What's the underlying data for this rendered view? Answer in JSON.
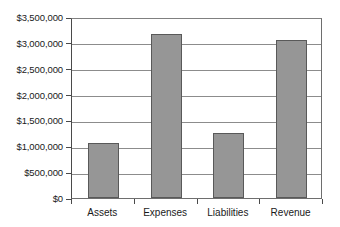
{
  "chart_data": {
    "type": "bar",
    "title": "",
    "subtitle": "",
    "xlabel": "",
    "ylabel": "",
    "categories": [
      "Assets",
      "Expenses",
      "Liabilities",
      "Revenue"
    ],
    "values": [
      1060000,
      3170000,
      1250000,
      3060000
    ],
    "series": [
      {
        "name": "Series 1",
        "values": [
          1060000,
          3170000,
          1250000,
          3060000
        ]
      }
    ],
    "ylim": [
      0,
      3500000
    ],
    "ytick_values": [
      0,
      500000,
      1000000,
      1500000,
      2000000,
      2500000,
      3000000,
      3500000
    ],
    "ytick_labels": [
      "$0",
      "$500,000",
      "$1,000,000",
      "$1,500,000",
      "$2,000,000",
      "$2,500,000",
      "$3,000,000",
      "$3,500,000"
    ],
    "grid": true,
    "grid_axis": "y",
    "legend": false,
    "legend_position": "none",
    "annotations": [],
    "colors": {
      "bar_fill": "#969696",
      "bar_border": "#595959",
      "gridline": "#8c8c8c",
      "axis": "#4a4a4a",
      "plot_background": "#ffffff",
      "text": "#1a1a1a"
    }
  }
}
